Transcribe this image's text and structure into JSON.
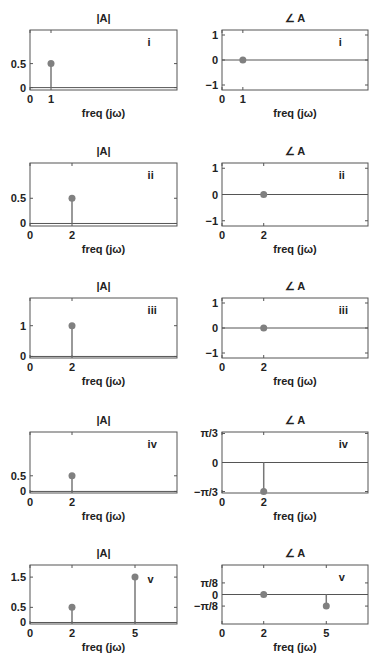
{
  "chart_data": [
    {
      "id": "i-mag",
      "type": "stem",
      "title": "|A|",
      "label": "i",
      "xlabel": "freq (jω)",
      "x": [
        1
      ],
      "values": [
        0.5
      ],
      "xticks": [
        "0",
        "1"
      ],
      "yticks": [
        "0",
        "0.5"
      ],
      "ylim": [
        -0.05,
        1.2
      ],
      "xlim": [
        0,
        7
      ]
    },
    {
      "id": "i-phase",
      "type": "stem",
      "title": "∠ A",
      "label": "i",
      "xlabel": "freq (jω)",
      "x": [
        1
      ],
      "values": [
        0
      ],
      "xticks": [
        "0",
        "1"
      ],
      "yticks": [
        "-1",
        "0",
        "1"
      ],
      "ylim": [
        -1.2,
        1.2
      ],
      "xlim": [
        0,
        7
      ]
    },
    {
      "id": "ii-mag",
      "type": "stem",
      "title": "|A|",
      "label": "ii",
      "xlabel": "freq (jω)",
      "x": [
        2
      ],
      "values": [
        0.5
      ],
      "xticks": [
        "0",
        "2"
      ],
      "yticks": [
        "0",
        "0.5"
      ],
      "ylim": [
        -0.05,
        1.2
      ],
      "xlim": [
        0,
        7
      ]
    },
    {
      "id": "ii-phase",
      "type": "stem",
      "title": "∠ A",
      "label": "ii",
      "xlabel": "freq (jω)",
      "x": [
        2
      ],
      "values": [
        0
      ],
      "xticks": [
        "0",
        "2"
      ],
      "yticks": [
        "-1",
        "0",
        "1"
      ],
      "ylim": [
        -1.2,
        1.2
      ],
      "xlim": [
        0,
        7
      ]
    },
    {
      "id": "iii-mag",
      "type": "stem",
      "title": "|A|",
      "label": "iii",
      "xlabel": "freq (jω)",
      "x": [
        2
      ],
      "values": [
        1
      ],
      "xticks": [
        "0",
        "2"
      ],
      "yticks": [
        "0",
        "1"
      ],
      "ylim": [
        -0.05,
        1.9
      ],
      "xlim": [
        0,
        7
      ]
    },
    {
      "id": "iii-phase",
      "type": "stem",
      "title": "∠ A",
      "label": "iii",
      "xlabel": "freq (jω)",
      "x": [
        2
      ],
      "values": [
        0
      ],
      "xticks": [
        "0",
        "2"
      ],
      "yticks": [
        "-1",
        "0",
        "1"
      ],
      "ylim": [
        -1.2,
        1.2
      ],
      "xlim": [
        0,
        7
      ]
    },
    {
      "id": "iv-mag",
      "type": "stem",
      "title": "|A|",
      "label": "iv",
      "xlabel": "freq (jω)",
      "x": [
        2
      ],
      "values": [
        0.5
      ],
      "xticks": [
        "0",
        "2"
      ],
      "yticks": [
        "0",
        "0.5"
      ],
      "ylim": [
        -0.05,
        1.9
      ],
      "xlim": [
        0,
        7
      ]
    },
    {
      "id": "iv-phase",
      "type": "stem",
      "title": "∠ A",
      "label": "iv",
      "xlabel": "freq (jω)",
      "x": [
        2
      ],
      "values": [
        -1.0472
      ],
      "xticks": [
        "0",
        "2"
      ],
      "yticks": [
        "-π/3",
        "0",
        "π/3"
      ],
      "ylim": [
        -1.1,
        1.1
      ],
      "xlim": [
        0,
        7
      ]
    },
    {
      "id": "v-mag",
      "type": "stem",
      "title": "|A|",
      "label": "v",
      "xlabel": "freq (jω)",
      "x": [
        2,
        5
      ],
      "values": [
        0.5,
        1.5
      ],
      "xticks": [
        "0",
        "2",
        "5"
      ],
      "yticks": [
        "0",
        "0.5",
        "1.5"
      ],
      "ylim": [
        -0.05,
        1.9
      ],
      "xlim": [
        0,
        7
      ]
    },
    {
      "id": "v-phase",
      "type": "stem",
      "title": "∠ A",
      "label": "v",
      "xlabel": "freq (jω)",
      "x": [
        2,
        5
      ],
      "values": [
        0,
        -0.3927
      ],
      "xticks": [
        "0",
        "2",
        "5"
      ],
      "yticks": [
        "-π/8",
        "0",
        "π/8"
      ],
      "ylim": [
        -1.0,
        1.0
      ],
      "xlim": [
        0,
        7
      ]
    }
  ],
  "panels": [
    {
      "title": "|A|",
      "label": "i",
      "xlabel": "freq (jω)"
    },
    {
      "title": "∠ A",
      "label": "i",
      "xlabel": "freq (jω)"
    },
    {
      "title": "|A|",
      "label": "ii",
      "xlabel": "freq (jω)"
    },
    {
      "title": "∠ A",
      "label": "ii",
      "xlabel": "freq (jω)"
    },
    {
      "title": "|A|",
      "label": "iii",
      "xlabel": "freq (jω)"
    },
    {
      "title": "∠ A",
      "label": "iii",
      "xlabel": "freq (jω)"
    },
    {
      "title": "|A|",
      "label": "iv",
      "xlabel": "freq (jω)"
    },
    {
      "title": "∠ A",
      "label": "iv",
      "xlabel": "freq (jω)"
    },
    {
      "title": "|A|",
      "label": "v",
      "xlabel": "freq (jω)"
    },
    {
      "title": "∠ A",
      "label": "v",
      "xlabel": "freq (jω)"
    }
  ],
  "colors": {
    "axis": "#555555",
    "stem": "#777777",
    "marker": "#808080",
    "text": "#222222"
  }
}
